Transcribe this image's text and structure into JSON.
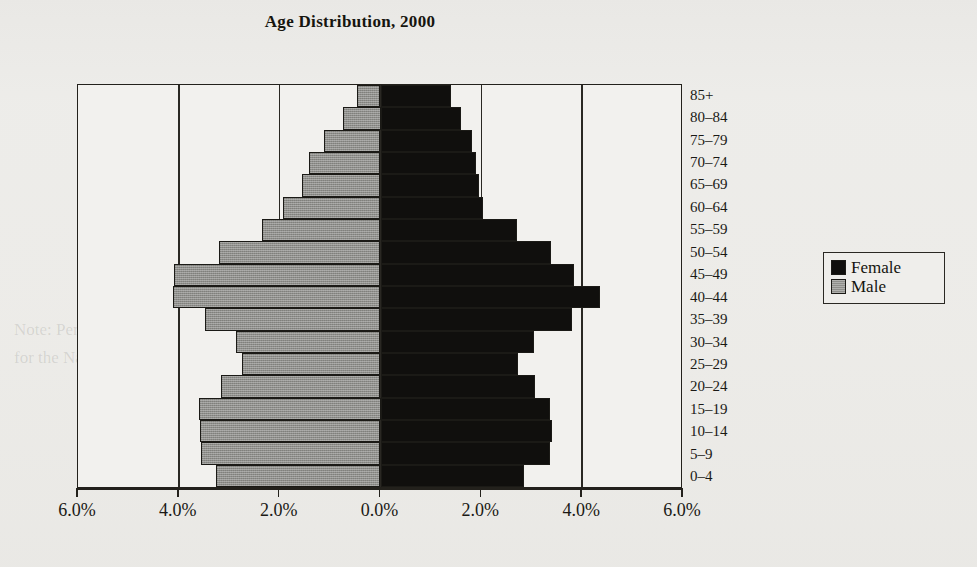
{
  "chart_data": {
    "type": "bar",
    "subtype": "population-pyramid",
    "title": "Age Distribution, 2000",
    "xlabel": "",
    "ylabel": "",
    "categories": [
      "85+",
      "80–84",
      "75–79",
      "70–74",
      "65–69",
      "60–64",
      "55–59",
      "50–54",
      "45–49",
      "40–44",
      "35–39",
      "30–34",
      "25–29",
      "20–24",
      "15–19",
      "10–14",
      "5–9",
      "0–4"
    ],
    "series": [
      {
        "name": "Male",
        "color": "#8e8e8a",
        "side": "left",
        "values": [
          0.47,
          0.75,
          1.13,
          1.41,
          1.56,
          1.93,
          2.35,
          3.21,
          4.09,
          4.11,
          3.49,
          2.87,
          2.74,
          3.17,
          3.6,
          3.58,
          3.56,
          3.26
        ]
      },
      {
        "name": "Female",
        "color": "#100f0d",
        "side": "right",
        "values": [
          1.39,
          1.6,
          1.82,
          1.89,
          1.95,
          2.04,
          2.7,
          3.38,
          3.83,
          4.35,
          3.79,
          3.04,
          2.72,
          3.06,
          3.36,
          3.41,
          3.36,
          2.85
        ]
      }
    ],
    "xlim": [
      -6.0,
      6.0
    ],
    "xticks": [
      -6.0,
      -4.0,
      -2.0,
      0.0,
      2.0,
      4.0,
      6.0
    ],
    "xtick_labels": [
      "6.0%",
      "4.0%",
      "2.0%",
      "0.0%",
      "2.0%",
      "4.0%",
      "6.0%"
    ],
    "gridlines": [
      -4.0,
      -2.0,
      0.0,
      2.0,
      4.0
    ],
    "grid": true,
    "legend_position": "right",
    "units": "percent of total population"
  },
  "legend": {
    "items": [
      {
        "label": "Female"
      },
      {
        "label": "Male"
      }
    ]
  },
  "background_text": [
    "Table 1",
    "Source:",
    "Columbia",
    "0.0 percent.",
    "Note: Percentages may not add to 100.0 because of rounding.",
    "for the Nation and for each of the 50 states, the District of Columbia"
  ]
}
